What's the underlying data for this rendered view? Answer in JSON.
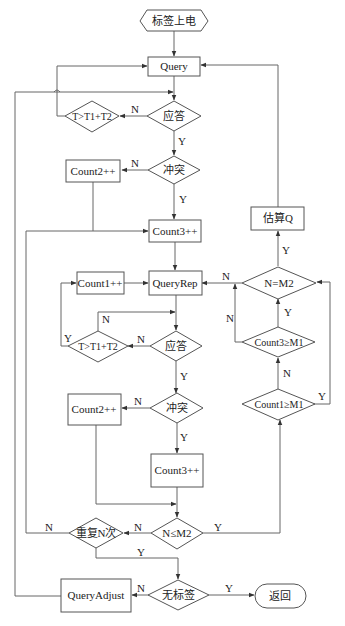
{
  "diagram": {
    "nodes": {
      "start": {
        "label": "标签上电",
        "shape": "hexagon"
      },
      "query": {
        "label": "Query",
        "shape": "rect"
      },
      "ack1": {
        "label": "应答",
        "shape": "diamond"
      },
      "timeout1": {
        "label": "T>T1+T2",
        "shape": "diamond"
      },
      "collision1": {
        "label": "冲突",
        "shape": "diamond"
      },
      "count2_a": {
        "label": "Count2++",
        "shape": "rect"
      },
      "count3_a": {
        "label": "Count3++",
        "shape": "rect"
      },
      "estimate_q": {
        "label": "估算Q",
        "shape": "rect"
      },
      "n_eq_m2": {
        "label": "N=M2",
        "shape": "diamond"
      },
      "query_rep": {
        "label": "QueryRep",
        "shape": "rect"
      },
      "count1": {
        "label": "Count1++",
        "shape": "rect"
      },
      "ack2": {
        "label": "应答",
        "shape": "diamond"
      },
      "timeout2": {
        "label": "T>T1+T2",
        "shape": "diamond"
      },
      "count3_ge_m1": {
        "label": "Count3≥M1",
        "shape": "diamond"
      },
      "count1_ge_m1": {
        "label": "Count1≥M1",
        "shape": "diamond"
      },
      "collision2": {
        "label": "冲突",
        "shape": "diamond"
      },
      "count2_b": {
        "label": "Count2++",
        "shape": "rect"
      },
      "count3_b": {
        "label": "Count3++",
        "shape": "rect"
      },
      "n_le_m2": {
        "label": "N≤M2",
        "shape": "diamond"
      },
      "repeat_n": {
        "label": "重复N次",
        "shape": "diamond"
      },
      "no_tag": {
        "label": "无标签",
        "shape": "diamond"
      },
      "query_adjust": {
        "label": "QueryAdjust",
        "shape": "rect"
      },
      "return": {
        "label": "返回",
        "shape": "stadium"
      }
    },
    "edge_labels": {
      "ack1_n": "N",
      "ack1_y": "Y",
      "collision1_n": "N",
      "collision1_y": "Y",
      "estimate_y": "Y",
      "n_eq_m2_n": "N",
      "count3_ge_m1_n": "N",
      "count3_ge_m1_y": "Y",
      "count1_ge_m1_n": "N",
      "count1_ge_m1_y": "Y",
      "timeout2_n": "N",
      "timeout2_y": "Y",
      "ack2_n": "N",
      "ack2_y": "Y",
      "collision2_n": "N",
      "collision2_y": "Y",
      "n_le_m2_n": "N",
      "n_le_m2_y": "Y",
      "repeat_n_n": "N",
      "repeat_n_y": "Y",
      "no_tag_n": "N",
      "no_tag_y": "Y"
    },
    "edges": [
      {
        "from": "start",
        "to": "query"
      },
      {
        "from": "query",
        "to": "ack1"
      },
      {
        "from": "ack1",
        "to": "timeout1",
        "label": "N"
      },
      {
        "from": "timeout1",
        "to": "query"
      },
      {
        "from": "ack1",
        "to": "collision1",
        "label": "Y"
      },
      {
        "from": "collision1",
        "to": "count2_a",
        "label": "N"
      },
      {
        "from": "collision1",
        "to": "count3_a",
        "label": "Y"
      },
      {
        "from": "count2_a",
        "to": "count3_a"
      },
      {
        "from": "count3_a",
        "to": "query_rep"
      },
      {
        "from": "count1",
        "to": "query_rep"
      },
      {
        "from": "query_rep",
        "to": "ack2"
      },
      {
        "from": "ack2",
        "to": "timeout2",
        "label": "N"
      },
      {
        "from": "timeout2",
        "to": "ack2",
        "label": "N"
      },
      {
        "from": "timeout2",
        "to": "count1",
        "label": "Y"
      },
      {
        "from": "ack2",
        "to": "collision2",
        "label": "Y"
      },
      {
        "from": "collision2",
        "to": "count2_b",
        "label": "N"
      },
      {
        "from": "collision2",
        "to": "count3_b",
        "label": "Y"
      },
      {
        "from": "count2_b",
        "to": "n_le_m2"
      },
      {
        "from": "count3_b",
        "to": "n_le_m2"
      },
      {
        "from": "n_le_m2",
        "to": "repeat_n",
        "label": "N"
      },
      {
        "from": "n_le_m2",
        "to": "count1_ge_m1",
        "label": "Y"
      },
      {
        "from": "count1_ge_m1",
        "to": "count3_ge_m1",
        "label": "N"
      },
      {
        "from": "count1_ge_m1",
        "to": "n_eq_m2",
        "label": "Y"
      },
      {
        "from": "count3_ge_m1",
        "to": "n_eq_m2",
        "label": "Y"
      },
      {
        "from": "count3_ge_m1",
        "to": "query_rep",
        "label": "N"
      },
      {
        "from": "n_eq_m2",
        "to": "query_rep",
        "label": "N"
      },
      {
        "from": "n_eq_m2",
        "to": "estimate_q",
        "label": "Y"
      },
      {
        "from": "estimate_q",
        "to": "query"
      },
      {
        "from": "repeat_n",
        "to": "count3_a",
        "label": "N"
      },
      {
        "from": "repeat_n",
        "to": "no_tag",
        "label": "Y"
      },
      {
        "from": "no_tag",
        "to": "query_adjust",
        "label": "N"
      },
      {
        "from": "no_tag",
        "to": "return",
        "label": "Y"
      },
      {
        "from": "query_adjust",
        "to": "ack1"
      }
    ]
  }
}
